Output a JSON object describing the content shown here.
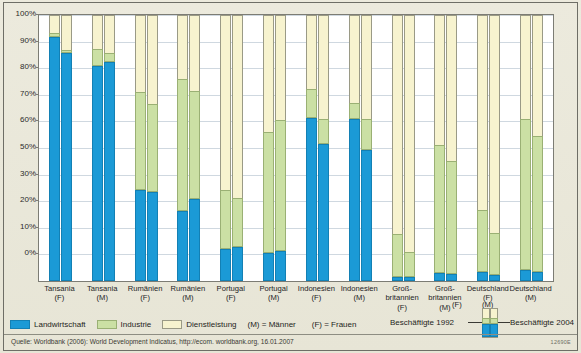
{
  "axis": {
    "y_ticks": [
      "100%",
      "90%",
      "80%",
      "70%",
      "60%",
      "50%",
      "30%",
      "20%",
      "10%",
      "0%"
    ],
    "y_tick_values": [
      100,
      90,
      80,
      70,
      60,
      50,
      40,
      30,
      20,
      10,
      0
    ]
  },
  "legend": {
    "items": [
      {
        "label": "Landwirtschaft",
        "swatch": "agri",
        "color": "#1b9ad6"
      },
      {
        "label": "Industrie",
        "swatch": "ind",
        "color": "#cbe0a4"
      },
      {
        "label": "Dienstleistung",
        "swatch": "serv",
        "color": "#f7f3cf"
      }
    ],
    "note_m": "(M) = Männer",
    "note_f": "(F) = Frauen",
    "year_left": "Beschäftigte 1992",
    "year_right": "Beschäftigte 2004",
    "tag_f": "(F)",
    "tag_m": "(M)"
  },
  "source": "Quelle: Worldbank (2006): World Development Indicatus, http://ecom. worldbank.org, 16.01.2007",
  "code": "12690E",
  "chart_data": {
    "type": "bar",
    "subtype": "stacked-100-percent-paired",
    "title": "",
    "xlabel": "",
    "ylabel": "",
    "ylim": [
      0,
      100
    ],
    "grid": true,
    "legend_position": "bottom",
    "series": [
      {
        "name": "Landwirtschaft",
        "color": "#1b9ad6"
      },
      {
        "name": "Industrie",
        "color": "#cbe0a4"
      },
      {
        "name": "Dienstleistung",
        "color": "#f7f3cf"
      }
    ],
    "pair_labels": [
      "Beschäftigte 1992",
      "Beschäftigte 2004"
    ],
    "categories": [
      {
        "line1": "Tansania",
        "line2": "(F)"
      },
      {
        "line1": "Tansania",
        "line2": "(M)"
      },
      {
        "line1": "Rumänien",
        "line2": "(F)"
      },
      {
        "line1": "Rumänien",
        "line2": "(M)"
      },
      {
        "line1": "Portugal",
        "line2": "(F)"
      },
      {
        "line1": "Portugal",
        "line2": "(M)"
      },
      {
        "line1": "Indonesien",
        "line2": "(F)"
      },
      {
        "line1": "Indonesien",
        "line2": "(M)"
      },
      {
        "line1": "Groß-",
        "line2": "britannien",
        "line3": "(F)"
      },
      {
        "line1": "Groß-",
        "line2": "britannien",
        "line3": "(M)"
      },
      {
        "line1": "Deutschland",
        "line2": "(F)"
      },
      {
        "line1": "Deutschland",
        "line2": "(M)"
      }
    ],
    "groups": [
      {
        "category": "Tansania (F)",
        "bars": [
          {
            "year": "1992",
            "agriculture": 91.5,
            "industry": 1.5,
            "services": 7.0
          },
          {
            "year": "2004",
            "agriculture": 85.5,
            "industry": 1.0,
            "services": 13.5
          }
        ]
      },
      {
        "category": "Tansania (M)",
        "bars": [
          {
            "year": "1992",
            "agriculture": 80.5,
            "industry": 6.5,
            "services": 13.0
          },
          {
            "year": "2004",
            "agriculture": 82.0,
            "industry": 3.5,
            "services": 14.5
          }
        ]
      },
      {
        "category": "Rumänien (F)",
        "bars": [
          {
            "year": "1992",
            "agriculture": 34.0,
            "industry": 36.5,
            "services": 29.5
          },
          {
            "year": "2004",
            "agriculture": 33.0,
            "industry": 33.0,
            "services": 34.0
          }
        ]
      },
      {
        "category": "Rumänien (M)",
        "bars": [
          {
            "year": "1992",
            "agriculture": 26.0,
            "industry": 49.5,
            "services": 24.5
          },
          {
            "year": "2004",
            "agriculture": 30.5,
            "industry": 40.5,
            "services": 29.0
          }
        ]
      },
      {
        "category": "Portugal (F)",
        "bars": [
          {
            "year": "1992",
            "agriculture": 11.8,
            "industry": 22.2,
            "services": 66.0
          },
          {
            "year": "2004",
            "agriculture": 12.5,
            "industry": 18.5,
            "services": 69.0
          }
        ]
      },
      {
        "category": "Portugal (M)",
        "bars": [
          {
            "year": "1992",
            "agriculture": 10.0,
            "industry": 45.5,
            "services": 44.5
          },
          {
            "year": "2004",
            "agriculture": 11.0,
            "industry": 49.0,
            "services": 40.0
          }
        ]
      },
      {
        "category": "Indonesien (F)",
        "bars": [
          {
            "year": "1992",
            "agriculture": 61.0,
            "industry": 11.0,
            "services": 28.0
          },
          {
            "year": "2004",
            "agriculture": 51.0,
            "industry": 9.5,
            "services": 39.5
          }
        ]
      },
      {
        "category": "Indonesien (M)",
        "bars": [
          {
            "year": "1992",
            "agriculture": 60.5,
            "industry": 6.0,
            "services": 33.5
          },
          {
            "year": "2004",
            "agriculture": 49.0,
            "industry": 11.5,
            "services": 39.5
          }
        ]
      },
      {
        "category": "Großbritannien (F)",
        "bars": [
          {
            "year": "1992",
            "agriculture": 1.3,
            "industry": 16.0,
            "services": 82.7
          },
          {
            "year": "2004",
            "agriculture": 1.0,
            "industry": 9.5,
            "services": 89.5
          }
        ]
      },
      {
        "category": "Großbritannien (M)",
        "bars": [
          {
            "year": "1992",
            "agriculture": 2.8,
            "industry": 48.0,
            "services": 49.2
          },
          {
            "year": "2004",
            "agriculture": 2.3,
            "industry": 42.5,
            "services": 55.2
          }
        ]
      },
      {
        "category": "Deutschland (F)",
        "bars": [
          {
            "year": "1992",
            "agriculture": 3.0,
            "industry": 23.5,
            "services": 73.5
          },
          {
            "year": "2004",
            "agriculture": 2.0,
            "industry": 15.5,
            "services": 82.5
          }
        ]
      },
      {
        "category": "Deutschland (M)",
        "bars": [
          {
            "year": "1992",
            "agriculture": 3.6,
            "industry": 57.0,
            "services": 39.4
          },
          {
            "year": "2004",
            "agriculture": 3.0,
            "industry": 51.0,
            "services": 46.0
          }
        ]
      }
    ]
  }
}
